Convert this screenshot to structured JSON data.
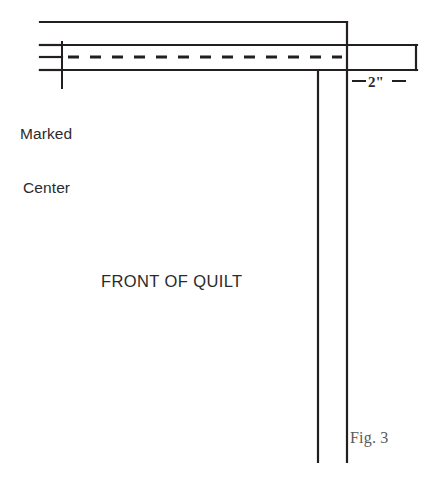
{
  "figure": {
    "caption": "Fig. 3"
  },
  "labels": {
    "marked_center_line1": "Marked",
    "marked_center_line2": "Center",
    "front_of_quilt": "FRONT OF QUILT",
    "dimension": "2\""
  },
  "colors": {
    "line": "#231f20",
    "text": "#2b2b2b",
    "caption_text": "#5a5a5a",
    "background": "#ffffff"
  },
  "geometry": {
    "stroke_width": 2.2,
    "dash_stroke_width": 3.2,
    "dash_pattern": "11 11",
    "top_edge_line": {
      "x1": 40,
      "y1": 22,
      "x2": 347,
      "y2": 22
    },
    "binding_band": {
      "left": 40,
      "right": 417,
      "top": 45,
      "bottom": 70
    },
    "binding_center_dashes": {
      "x1": 68,
      "y1": 57,
      "x2": 340,
      "y2": 57
    },
    "left_stub_upper": {
      "x1": 40,
      "y1": 45,
      "x2": 62,
      "y2": 45
    },
    "left_stub_middle": {
      "x1": 40,
      "y1": 57,
      "x2": 62,
      "y2": 57
    },
    "left_stub_lower": {
      "x1": 40,
      "y1": 70,
      "x2": 62,
      "y2": 70
    },
    "marked_center_tick": {
      "x1": 62,
      "y1": 42,
      "x2": 62,
      "y2": 88
    },
    "quilt_edge_vertical_inner": {
      "x1": 318,
      "y1": 70,
      "x2": 318,
      "y2": 462
    },
    "quilt_edge_vertical_outer": {
      "x1": 347,
      "y1": 22,
      "x2": 347,
      "y2": 462
    },
    "dimension_tick_left": {
      "x1": 352,
      "y1": 81,
      "x2": 366,
      "y2": 81
    },
    "dimension_tick_right": {
      "x1": 392,
      "y1": 81,
      "x2": 406,
      "y2": 81
    }
  }
}
